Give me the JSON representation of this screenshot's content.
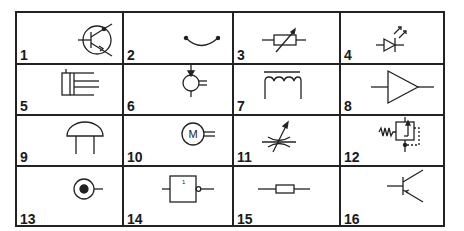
{
  "figure": {
    "cells": [
      {
        "number": "1",
        "symbol": "pnp-transistor-in-circle-icon"
      },
      {
        "number": "2",
        "symbol": "arc-with-end-points-icon"
      },
      {
        "number": "3",
        "symbol": "variable-resistor-icon"
      },
      {
        "number": "4",
        "symbol": "light-emitting-diode-icon"
      },
      {
        "number": "5",
        "symbol": "hydraulic-cylinder-icon"
      },
      {
        "number": "6",
        "symbol": "pump-motor-icon"
      },
      {
        "number": "7",
        "symbol": "inductor-with-core-icon"
      },
      {
        "number": "8",
        "symbol": "amplifier-triangle-icon"
      },
      {
        "number": "9",
        "symbol": "dome-two-legs-icon"
      },
      {
        "number": "10",
        "symbol": "electric-motor-icon",
        "label": "M"
      },
      {
        "number": "11",
        "symbol": "variable-capacitor-icon"
      },
      {
        "number": "12",
        "symbol": "pressure-relief-valve-icon"
      },
      {
        "number": "13",
        "symbol": "bullseye-terminal-icon"
      },
      {
        "number": "14",
        "symbol": "not-gate-icon",
        "label": "1"
      },
      {
        "number": "15",
        "symbol": "resistor-fuse-icon"
      },
      {
        "number": "16",
        "symbol": "npn-transistor-icon"
      }
    ]
  }
}
